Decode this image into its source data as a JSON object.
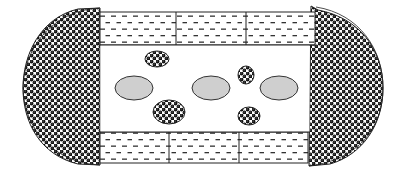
{
  "diagram": {
    "colors": {
      "background": "#ffffff",
      "outline": "#222222",
      "dot_fill": "#111111",
      "dash_fill": "#333333",
      "ellipse_gray": "#cfcfcf"
    },
    "regions": {
      "left_cap": {
        "pattern": "dotted-spheres",
        "x0": 23,
        "x1": 100,
        "y0": 8,
        "y1": 165
      },
      "right_cap": {
        "pattern": "dotted-spheres",
        "x0": 309,
        "x1": 383,
        "y0": 7,
        "y1": 165
      },
      "top_band": {
        "pattern": "dashed",
        "x0": 100,
        "x1": 315,
        "y0": 12,
        "y1": 45,
        "dividers": [
          176,
          246
        ]
      },
      "bottom_band": {
        "pattern": "dashed",
        "x0": 100,
        "x1": 308,
        "y0": 132,
        "y1": 163,
        "dividers": [
          169,
          239
        ]
      },
      "center": {
        "pattern": "blank",
        "x0": 100,
        "x1": 312,
        "y0": 45,
        "y1": 132
      }
    },
    "gray_ellipses": [
      {
        "cx": 134,
        "cy": 88,
        "rx": 19,
        "ry": 12
      },
      {
        "cx": 211,
        "cy": 88,
        "rx": 19,
        "ry": 12
      },
      {
        "cx": 279,
        "cy": 88,
        "rx": 19,
        "ry": 12
      }
    ],
    "dotted_ellipses": [
      {
        "cx": 157,
        "cy": 59,
        "rx": 12,
        "ry": 8
      },
      {
        "cx": 169,
        "cy": 112,
        "rx": 16,
        "ry": 12
      },
      {
        "cx": 246,
        "cy": 75,
        "rx": 8,
        "ry": 9
      },
      {
        "cx": 249,
        "cy": 116,
        "rx": 11,
        "ry": 9
      }
    ]
  }
}
